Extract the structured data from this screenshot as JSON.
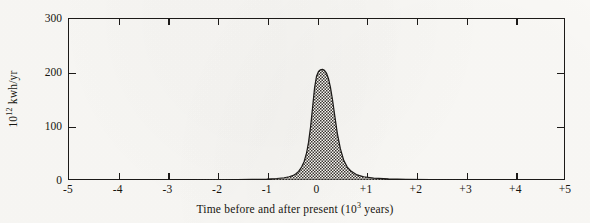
{
  "chart_data": {
    "type": "area",
    "title": "",
    "xlabel": "Time before and after present (10³ years)",
    "ylabel": "10¹² kwh/yr",
    "xlabel_parts": {
      "pre": "Time before and after present (10",
      "exp": "3",
      "post": " years)"
    },
    "ylabel_parts": {
      "pre": "10",
      "exp": "12",
      "post": " kwh/yr"
    },
    "xlim": [
      -5,
      5
    ],
    "ylim": [
      0,
      300
    ],
    "xticks": [
      -5,
      -4,
      -3,
      -2,
      -1,
      0,
      1,
      2,
      3,
      4,
      5
    ],
    "xtick_labels": [
      "-5",
      "-4",
      "-3",
      "-2",
      "-1",
      "0",
      "+1",
      "+2",
      "+3",
      "+4",
      "+5"
    ],
    "yticks": [
      0,
      100,
      200,
      300
    ],
    "ytick_labels": [
      "0",
      "100",
      "200",
      "300"
    ],
    "grid": false,
    "legend": null,
    "ticks_direction": "inward",
    "frame": "box",
    "fill_style": "cross-hatched",
    "series": [
      {
        "name": "Fossil fuel consumption rate",
        "peak_x": 0.12,
        "peak_y": 205,
        "x": [
          -5.0,
          -4.5,
          -4.0,
          -3.5,
          -3.0,
          -2.5,
          -2.0,
          -1.6,
          -1.3,
          -1.0,
          -0.8,
          -0.65,
          -0.55,
          -0.48,
          -0.42,
          -0.36,
          -0.3,
          -0.25,
          -0.2,
          -0.16,
          -0.12,
          -0.08,
          -0.04,
          0.0,
          0.04,
          0.08,
          0.12,
          0.16,
          0.2,
          0.24,
          0.28,
          0.32,
          0.36,
          0.42,
          0.48,
          0.55,
          0.62,
          0.7,
          0.8,
          0.95,
          1.15,
          1.45,
          1.8,
          2.3,
          3.0,
          4.0,
          5.0
        ],
        "y": [
          0.0,
          0.0,
          0.0,
          0.0,
          0.0,
          0.0,
          0.3,
          0.6,
          1.0,
          1.8,
          2.8,
          4.2,
          6.0,
          8.0,
          11.0,
          16.0,
          24.0,
          34.0,
          50.0,
          70.0,
          98.0,
          133.0,
          170.0,
          192.0,
          201.0,
          204.0,
          205.0,
          203.0,
          198.0,
          188.0,
          172.0,
          150.0,
          124.0,
          86.0,
          58.0,
          36.0,
          24.0,
          16.0,
          10.0,
          6.0,
          3.4,
          2.0,
          1.2,
          0.6,
          0.2,
          0.0,
          0.0
        ]
      }
    ]
  }
}
